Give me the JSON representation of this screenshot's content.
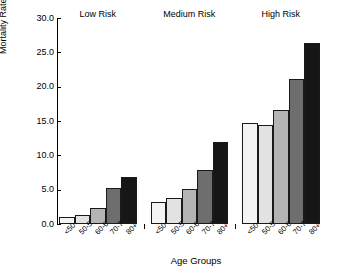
{
  "chart_data": {
    "type": "bar",
    "title": "",
    "xlabel": "Age Groups",
    "ylabel": "Mortality Rate (%)",
    "ylim": [
      0.0,
      30.0
    ],
    "yticks": [
      "0.0",
      "5.0",
      "10.0",
      "15.0",
      "20.0",
      "25.0",
      "30.0"
    ],
    "ytick_values": [
      0.0,
      5.0,
      10.0,
      15.0,
      20.0,
      25.0,
      30.0
    ],
    "grid": false,
    "legend": "none",
    "categories": [
      "<50",
      "50-59",
      "60-69",
      "70-79",
      "80+"
    ],
    "group_labels": [
      "Low Risk",
      "Medium Risk",
      "High Risk"
    ],
    "series": [
      {
        "name": "Low Risk",
        "values": [
          0.9,
          1.2,
          2.3,
          5.2,
          6.8
        ]
      },
      {
        "name": "Medium Risk",
        "values": [
          3.1,
          3.7,
          5.0,
          7.8,
          11.9
        ]
      },
      {
        "name": "High Risk",
        "values": [
          14.6,
          14.4,
          16.6,
          21.0,
          26.3
        ]
      }
    ],
    "bar_colors": [
      "#f4f4f4",
      "#e2e2e2",
      "#b4b4b4",
      "#6e6e6e",
      "#161616"
    ],
    "bar_edge_color": "#1a1a1a"
  },
  "axis": {
    "y_label": "Mortality Rate (%)",
    "x_label": "Age Groups",
    "y_tick_labels": [
      "30.0",
      "25.0",
      "20.0",
      "15.0",
      "10.0",
      "5.0",
      "0.0"
    ]
  },
  "groups": [
    {
      "title": "Low Risk"
    },
    {
      "title": "Medium Risk"
    },
    {
      "title": "High Risk"
    }
  ]
}
